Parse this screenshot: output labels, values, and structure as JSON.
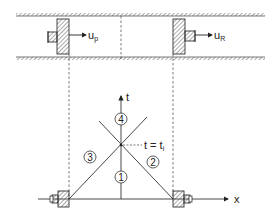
{
  "figure": {
    "top": {
      "left_piston_velocity": {
        "symbol": "u",
        "subscript": "p"
      },
      "right_piston_velocity": {
        "symbol": "u",
        "subscript": "R"
      }
    },
    "bottom": {
      "axes": {
        "x_label": "x",
        "t_label": "t"
      },
      "intersection_label": "t = t",
      "intersection_subscript": "i",
      "regions": [
        "1",
        "2",
        "3",
        "4"
      ]
    }
  },
  "colors": {
    "line": "#333333",
    "hatch": "#555555",
    "background": "#ffffff"
  }
}
